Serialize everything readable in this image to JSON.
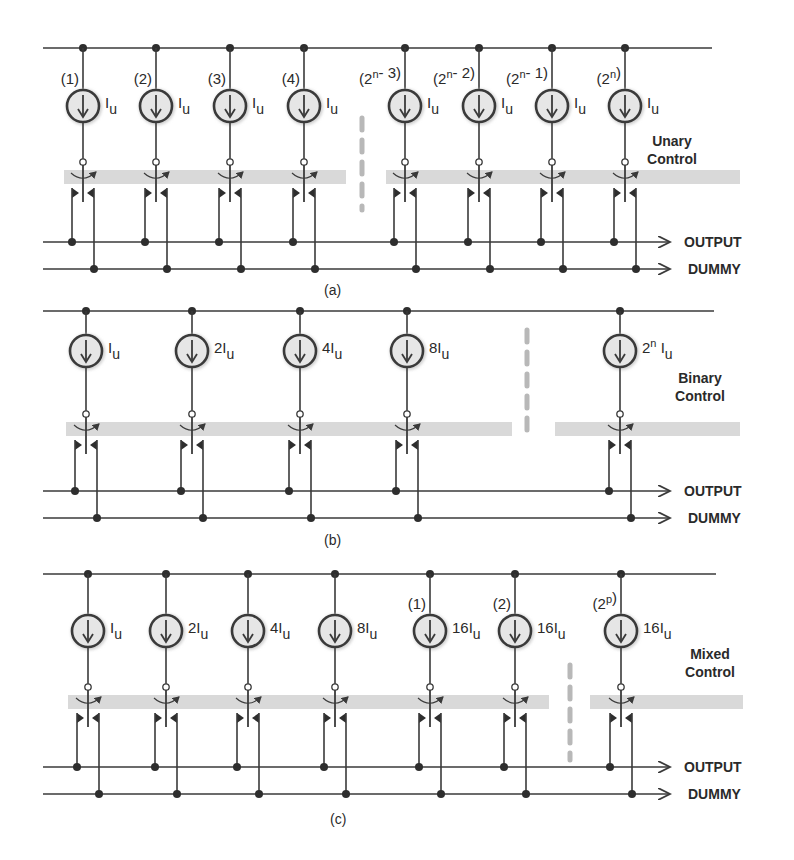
{
  "figure": {
    "colors": {
      "wire": "#3a3a3a",
      "node": "#2e2e2e",
      "source_fill": "#e6e6e6",
      "control_band": "#d9d9d9",
      "dash": "#b8b8b8",
      "text": "#2a2a2a"
    },
    "rails": {
      "output_label": "OUTPUT",
      "dummy_label": "DUMMY"
    },
    "panels": [
      {
        "id": "a",
        "caption": "(a)",
        "control_label_1": "Unary",
        "control_label_2": "Control",
        "top_y": 48,
        "top_x2": 712,
        "source_y": 106,
        "out_y": 242,
        "dum_y": 269,
        "band_y": 176,
        "bands": [
          [
            64,
            346
          ],
          [
            386,
            740
          ]
        ],
        "dash_x": 362,
        "dash_y": [
          118,
          210
        ],
        "control_xy": [
          672,
          146
        ],
        "caption_xy": [
          324,
          295
        ],
        "cells": [
          {
            "x": 83,
            "index": "(1)",
            "current": "I",
            "current_sub": "u",
            "coef": ""
          },
          {
            "x": 156,
            "index": "(2)",
            "current": "I",
            "current_sub": "u",
            "coef": ""
          },
          {
            "x": 230,
            "index": "(3)",
            "current": "I",
            "current_sub": "u",
            "coef": ""
          },
          {
            "x": 304,
            "index": "(4)",
            "current": "I",
            "current_sub": "u",
            "coef": ""
          },
          {
            "x": 405,
            "index": "(2^n- 3)",
            "current": "I",
            "current_sub": "u",
            "coef": ""
          },
          {
            "x": 479,
            "index": "(2^n- 2)",
            "current": "I",
            "current_sub": "u",
            "coef": ""
          },
          {
            "x": 552,
            "index": "(2^n- 1)",
            "current": "I",
            "current_sub": "u",
            "coef": ""
          },
          {
            "x": 625,
            "index": "(2^n)",
            "current": "I",
            "current_sub": "u",
            "coef": ""
          }
        ]
      },
      {
        "id": "b",
        "caption": "(b)",
        "control_label_1": "Binary",
        "control_label_2": "Control",
        "top_y": 311,
        "top_x2": 714,
        "source_y": 351,
        "out_y": 491,
        "dum_y": 518,
        "band_y": 428,
        "bands": [
          [
            66,
            512
          ],
          [
            555,
            740
          ]
        ],
        "dash_x": 527,
        "dash_y": [
          330,
          440
        ],
        "control_xy": [
          700,
          383
        ],
        "caption_xy": [
          324,
          545
        ],
        "cells": [
          {
            "x": 86,
            "index": "",
            "current": "I",
            "current_sub": "u",
            "coef": ""
          },
          {
            "x": 192,
            "index": "",
            "current": "I",
            "current_sub": "u",
            "coef": "2"
          },
          {
            "x": 300,
            "index": "",
            "current": "I",
            "current_sub": "u",
            "coef": "4"
          },
          {
            "x": 407,
            "index": "",
            "current": "I",
            "current_sub": "u",
            "coef": "8"
          },
          {
            "x": 620,
            "index": "",
            "current": "I",
            "current_sub": "u",
            "coef": "2^n "
          }
        ]
      },
      {
        "id": "c",
        "caption": "(c)",
        "control_label_1": "Mixed",
        "control_label_2": "Control",
        "top_y": 574,
        "top_x2": 716,
        "source_y": 631,
        "out_y": 767,
        "dum_y": 794,
        "band_y": 701,
        "bands": [
          [
            68,
            549
          ],
          [
            590,
            743
          ]
        ],
        "dash_x": 570,
        "dash_y": [
          665,
          760
        ],
        "control_xy": [
          710,
          659
        ],
        "caption_xy": [
          330,
          824
        ],
        "cells": [
          {
            "x": 88,
            "index": "",
            "current": "I",
            "current_sub": "u",
            "coef": ""
          },
          {
            "x": 166,
            "index": "",
            "current": "I",
            "current_sub": "u",
            "coef": "2"
          },
          {
            "x": 248,
            "index": "",
            "current": "I",
            "current_sub": "u",
            "coef": "4"
          },
          {
            "x": 335,
            "index": "",
            "current": "I",
            "current_sub": "u",
            "coef": "8"
          },
          {
            "x": 430,
            "index": "(1)",
            "current": "I",
            "current_sub": "u",
            "coef": "16"
          },
          {
            "x": 515,
            "index": "(2)",
            "current": "I",
            "current_sub": "u",
            "coef": "16"
          },
          {
            "x": 621,
            "index": "(2^p)",
            "current": "I",
            "current_sub": "u",
            "coef": "16"
          }
        ]
      }
    ]
  }
}
